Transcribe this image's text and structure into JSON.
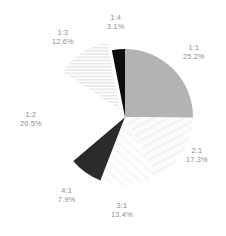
{
  "chart_data": {
    "type": "pie",
    "title": "",
    "subtitle": "",
    "xlabel": "",
    "ylabel": "",
    "legend_position": "none",
    "grid": false,
    "label_format": "name + percent",
    "categories": [
      "1:1",
      "2:1",
      "3:1",
      "4:1",
      "1:2",
      "1:3",
      "1:4"
    ],
    "values": [
      25.2,
      17.3,
      13.4,
      7.9,
      20.5,
      12.6,
      3.1
    ],
    "labels": [
      "25.2%",
      "17.3%",
      "13.4%",
      "7.9%",
      "20.5%",
      "12.6%",
      "3.1%"
    ],
    "start_angle_deg": -90,
    "direction": "clockwise",
    "exploded": [
      "1:3"
    ],
    "slices": [
      {
        "name": "1:1",
        "value": 25.2,
        "percent_label": "25.2%",
        "fill": "#b3b3b3",
        "pattern": "solid",
        "label_x": 183,
        "label_y": 43
      },
      {
        "name": "2:1",
        "value": 17.3,
        "percent_label": "17.3%",
        "fill": "#fbfbfb",
        "pattern": "faint-radial-stripe",
        "label_x": 186,
        "label_y": 146
      },
      {
        "name": "3:1",
        "value": 13.4,
        "percent_label": "13.4%",
        "fill": "#fcfcfc",
        "pattern": "faint-radial-stripe",
        "label_x": 111,
        "label_y": 201
      },
      {
        "name": "4:1",
        "value": 7.9,
        "percent_label": "7.9%",
        "fill": "#2b2b2b",
        "pattern": "solid",
        "label_x": 58,
        "label_y": 186
      },
      {
        "name": "1:2",
        "value": 20.5,
        "percent_label": "20.5%",
        "fill": "#ffffff",
        "pattern": "solid",
        "label_x": 20,
        "label_y": 110
      },
      {
        "name": "1:3",
        "value": 12.6,
        "percent_label": "12.6%",
        "fill": "#f7f7f7",
        "pattern": "horizontal-stripe",
        "label_x": 52,
        "label_y": 28
      },
      {
        "name": "1:4",
        "value": 3.1,
        "percent_label": "3.1%",
        "fill": "#0d0d0d",
        "pattern": "solid",
        "label_x": 107,
        "label_y": 13
      }
    ],
    "geometry": {
      "center_x": 125,
      "center_y": 117,
      "radius": 68,
      "explode_offset": 9
    },
    "colors": {
      "background": "#ffffff",
      "label_text": "#8e8e8e",
      "slice_gray": "#b3b3b3",
      "slice_dark": "#2b2b2b",
      "slice_black": "#0d0d0d",
      "slice_white": "#ffffff"
    }
  }
}
